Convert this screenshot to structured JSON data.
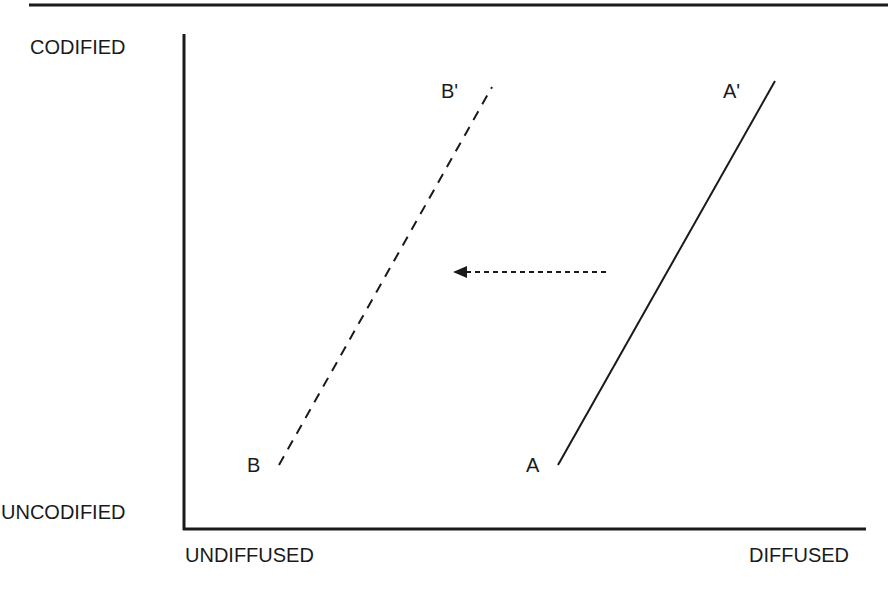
{
  "diagram": {
    "type": "knowledge-space",
    "y_axis": {
      "top_label": "CODIFIED",
      "bottom_label": "UNCODIFIED"
    },
    "x_axis": {
      "left_label": "UNDIFFUSED",
      "right_label": "DIFFUSED"
    },
    "curves": [
      {
        "id": "A",
        "start_label": "A",
        "end_label": "A'",
        "style": "solid"
      },
      {
        "id": "B",
        "start_label": "B",
        "end_label": "B'",
        "style": "dashed"
      }
    ],
    "shift_arrow": {
      "direction": "left",
      "style": "dotted",
      "from": "A-A'",
      "to": "B-B'"
    },
    "colors": {
      "ink": "#1a1a1a",
      "background": "#ffffff"
    }
  }
}
